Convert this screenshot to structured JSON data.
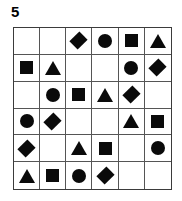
{
  "puzzle": {
    "label": "5",
    "grid": {
      "rows": 6,
      "columns": 6,
      "shape_color": "#0a0a0a",
      "grid_line_color": "#555555",
      "border_color": "#3b3b3b",
      "background_color": "#ffffff",
      "shape_names": [
        "empty",
        "diamond",
        "circle",
        "square",
        "triangle"
      ],
      "cells": [
        [
          "empty",
          "empty",
          "diamond",
          "circle",
          "square",
          "triangle"
        ],
        [
          "square",
          "triangle",
          "empty",
          "empty",
          "circle",
          "diamond"
        ],
        [
          "empty",
          "circle",
          "square",
          "triangle",
          "diamond",
          "empty"
        ],
        [
          "circle",
          "diamond",
          "empty",
          "empty",
          "triangle",
          "square"
        ],
        [
          "diamond",
          "empty",
          "triangle",
          "square",
          "empty",
          "circle"
        ],
        [
          "triangle",
          "square",
          "circle",
          "diamond",
          "empty",
          "empty"
        ]
      ]
    }
  }
}
